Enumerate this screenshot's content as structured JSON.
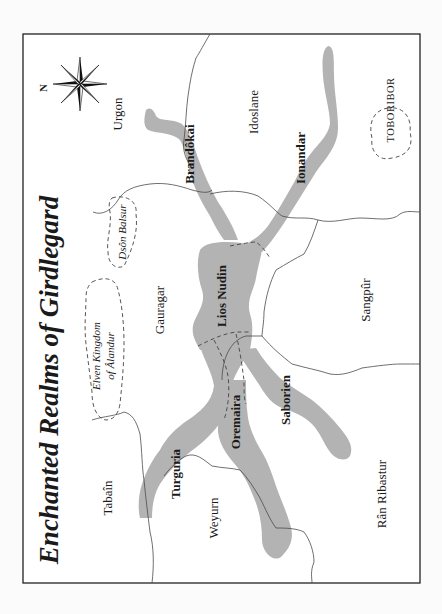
{
  "map": {
    "title": "Enchanted Realms of Girdlegard",
    "compass": {
      "north_label": "N"
    },
    "regions": [
      {
        "id": "urgon",
        "label": "Urgon"
      },
      {
        "id": "idoslane",
        "label": "Idoslane"
      },
      {
        "id": "gauragar",
        "label": "Gauragar"
      },
      {
        "id": "sangpur",
        "label": "Sangpûr"
      },
      {
        "id": "tabain",
        "label": "Tabaîn"
      },
      {
        "id": "weyurn",
        "label": "Weyurn"
      },
      {
        "id": "ran-ribastur",
        "label": "Rân Ribastur"
      }
    ],
    "enclaves": [
      {
        "id": "toboribor",
        "label": "TOBORIBOR"
      },
      {
        "id": "dson-balsur",
        "label": "Dsôn Balsur"
      },
      {
        "id": "alandur-line1",
        "label": "Elven Kingdom"
      },
      {
        "id": "alandur-line2",
        "label": "of Âlandur"
      }
    ],
    "waters": [
      {
        "id": "brandokai",
        "label": "Brandôkai"
      },
      {
        "id": "ionandar",
        "label": "Ionandar"
      },
      {
        "id": "lios-nudin",
        "label": "Lios Nudin"
      },
      {
        "id": "turguria",
        "label": "Turguria"
      },
      {
        "id": "oremaira",
        "label": "Oremaira"
      },
      {
        "id": "saborien",
        "label": "Saborien"
      }
    ],
    "colors": {
      "water": "#b3b3b3",
      "border": "#4a4a4a",
      "frame": "#222222",
      "background": "#ffffff"
    }
  }
}
